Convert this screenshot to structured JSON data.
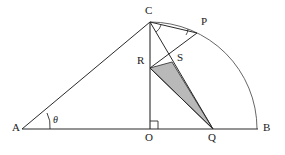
{
  "figure": {
    "canvas": {
      "width": 285,
      "height": 155
    },
    "colors": {
      "stroke": "#2a2a2a",
      "thin_stroke": "#555555",
      "shaded_fill": "#b9b9b9",
      "shaded_stroke": "#3a3a3a",
      "background": "#ffffff"
    },
    "points": {
      "A": {
        "x": 22,
        "y": 129,
        "label": "A",
        "label_x": 12,
        "label_y": 124
      },
      "B": {
        "x": 258,
        "y": 129,
        "label": "B",
        "label_x": 262,
        "label_y": 124
      },
      "O": {
        "x": 150,
        "y": 129,
        "label": "O",
        "label_x": 145,
        "label_y": 134
      },
      "C": {
        "x": 150,
        "y": 22,
        "label": "C",
        "label_x": 146,
        "label_y": 8
      },
      "P": {
        "x": 197,
        "y": 33,
        "label": "P",
        "label_x": 202,
        "label_y": 19
      },
      "Q": {
        "x": 213,
        "y": 129,
        "label": "Q",
        "label_x": 208,
        "label_y": 134
      },
      "R": {
        "x": 150,
        "y": 68,
        "label": "R",
        "label_x": 138,
        "label_y": 58
      },
      "S": {
        "x": 172,
        "y": 62,
        "label": "S",
        "label_x": 177,
        "label_y": 56
      }
    },
    "angles": {
      "theta": {
        "label": "θ",
        "at": "A",
        "label_x": 52,
        "label_y": 117
      },
      "right_angle": {
        "at": "O",
        "label": "right-angle-mark"
      },
      "arc_at_C": {
        "at": "C",
        "label": "angle-arc-c"
      },
      "arc_at_P": {
        "at": "P",
        "label": "angle-arc-p"
      }
    },
    "segments": [
      {
        "name": "segment-AB",
        "from": "A",
        "to": "B"
      },
      {
        "name": "segment-OC",
        "from": "O",
        "to": "C"
      },
      {
        "name": "segment-AC",
        "from": "A",
        "to": "C"
      },
      {
        "name": "segment-CQ",
        "from": "C",
        "to": "Q"
      },
      {
        "name": "segment-CP",
        "from": "C",
        "to": "P"
      },
      {
        "name": "segment-RP",
        "from": "R",
        "to": "P"
      },
      {
        "name": "segment-RQ",
        "from": "R",
        "to": "Q"
      }
    ],
    "arc": {
      "name": "quarter-circle-arc-CB",
      "center": "O",
      "radius": 107,
      "from": "C",
      "to": "B"
    },
    "shaded_region": {
      "name": "shaded-triangle-RSQ",
      "vertices": [
        "R",
        "S",
        "Q"
      ],
      "fill": "#b9b9b9"
    }
  }
}
